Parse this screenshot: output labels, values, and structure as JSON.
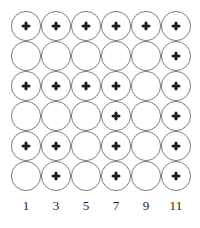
{
  "figure": {
    "title": "",
    "width": 200,
    "height": 228,
    "background": "#ffffff"
  },
  "grid": {
    "rows": 6,
    "cols": 6,
    "origin_x": 11,
    "origin_y": 11,
    "cell_size": 30,
    "circle_radius": 14.6,
    "circle_stroke": "#6e6e6e",
    "circle_stroke_width": 0.9,
    "circle_fill": "#ffffff",
    "marker_color": "#1a1a1a",
    "marker_name": "quincunx-cross-marker",
    "marker_glyph": "✤",
    "marker_size": 10,
    "filled_matrix": [
      [
        1,
        1,
        1,
        1,
        1,
        1
      ],
      [
        0,
        0,
        0,
        0,
        0,
        1
      ],
      [
        1,
        1,
        1,
        1,
        0,
        1
      ],
      [
        0,
        0,
        0,
        1,
        0,
        1
      ],
      [
        1,
        1,
        0,
        1,
        0,
        1
      ],
      [
        0,
        1,
        0,
        1,
        0,
        1
      ]
    ]
  },
  "chart_data": {
    "type": "heatmap",
    "title": "",
    "xlabel": "",
    "ylabel": "",
    "grid": true,
    "legend": "none",
    "categories": [
      "1",
      "3",
      "5",
      "7",
      "9",
      "11"
    ],
    "x": [
      1,
      3,
      5,
      7,
      9,
      11
    ],
    "rows": 6,
    "cols": 6,
    "cell_shape": "circle",
    "marker_symbol": "cross",
    "encoding": "1 = circle contains cross marker, 0 = empty circle",
    "values": [
      [
        1,
        1,
        1,
        1,
        1,
        1
      ],
      [
        0,
        0,
        0,
        0,
        0,
        1
      ],
      [
        1,
        1,
        1,
        1,
        0,
        1
      ],
      [
        0,
        0,
        0,
        1,
        0,
        1
      ],
      [
        1,
        1,
        0,
        1,
        0,
        1
      ],
      [
        0,
        1,
        0,
        1,
        0,
        1
      ]
    ],
    "series": [
      {
        "name": "row-1",
        "values": [
          1,
          1,
          1,
          1,
          1,
          1
        ]
      },
      {
        "name": "row-2",
        "values": [
          0,
          0,
          0,
          0,
          0,
          1
        ]
      },
      {
        "name": "row-3",
        "values": [
          1,
          1,
          1,
          1,
          0,
          1
        ]
      },
      {
        "name": "row-4",
        "values": [
          0,
          0,
          0,
          1,
          0,
          1
        ]
      },
      {
        "name": "row-5",
        "values": [
          1,
          1,
          0,
          1,
          0,
          1
        ]
      },
      {
        "name": "row-6",
        "values": [
          0,
          1,
          0,
          1,
          0,
          1
        ]
      }
    ],
    "column_totals": [
      3,
      4,
      3,
      5,
      1,
      6
    ],
    "row_totals": [
      6,
      1,
      5,
      2,
      4,
      3
    ],
    "total_marked": 21,
    "total_cells": 36,
    "xtick_labels": [
      "1",
      "3",
      "5",
      "7",
      "9",
      "11"
    ],
    "ytick_labels": []
  },
  "axis": {
    "labels": [
      "1",
      "3",
      "5",
      "7",
      "9",
      "11"
    ]
  }
}
